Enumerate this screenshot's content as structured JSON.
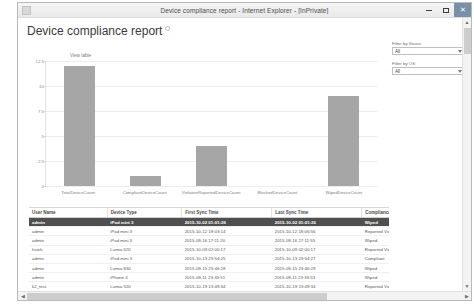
{
  "window": {
    "title": "Device compliance report - Internet Explorer - [InPrivate]",
    "minimize_label": "Minimize",
    "maximize_label": "Restore",
    "close_label": "✕"
  },
  "page": {
    "title": "Device compliance report",
    "view_table_link": "View table"
  },
  "filters": [
    {
      "label": "Filter by Status",
      "value": "All"
    },
    {
      "label": "Filter by OS",
      "value": "All"
    }
  ],
  "chart_data": {
    "type": "bar",
    "title": "",
    "xlabel": "",
    "ylabel": "",
    "categories": [
      "TotalDeviceCount",
      "CompliantDeviceCount",
      "ViolationReportedDeviceCount",
      "BlockedDeviceCount",
      "WipedDeviceCount"
    ],
    "values": [
      12,
      1,
      4,
      0,
      9
    ],
    "ylim": [
      0,
      12.5
    ],
    "yticks": [
      "12.5",
      "10",
      "7.5",
      "5",
      "2.5",
      "0"
    ],
    "ytick_values": [
      12.5,
      10,
      7.5,
      5,
      2.5,
      0
    ],
    "grid": true,
    "legend": "none",
    "bar_color": "#a6a6a6"
  },
  "table": {
    "columns": [
      "User Name",
      "Device Type",
      "First Sync Time",
      "Last Sync Time",
      "Compliance Status"
    ],
    "rows": [
      {
        "user": "admin",
        "device": "iPad mini 3",
        "first": "2015-10-02 01:01:26",
        "last": "2015-10-02 01:01:26",
        "status": "Wiped",
        "selected": true
      },
      {
        "user": "admin",
        "device": "iPad mini 3",
        "first": "2015-10-12 18:03:14",
        "last": "2015-10-12 18:06:56",
        "status": "Reported Violation",
        "selected": false
      },
      {
        "user": "admin",
        "device": "iPad mini 3",
        "first": "2015-09-16 17:11:20",
        "last": "2015-09-16 17:11:55",
        "status": "Wiped",
        "selected": false
      },
      {
        "user": "hsieh",
        "device": "Lumia 620",
        "first": "2015-10-09 02:00:17",
        "last": "2015-10-09 02:00:17",
        "status": "Reported Violation",
        "selected": false
      },
      {
        "user": "admin",
        "device": "iPad mini 3",
        "first": "2015-10-13 23:54:25",
        "last": "2015-10-13 23:54:27",
        "status": "Compliant",
        "selected": false
      },
      {
        "user": "admin",
        "device": "Lumia 830",
        "first": "2015-09-15 23:46:28",
        "last": "2015-09-15 23:46:29",
        "status": "Wiped",
        "selected": false
      },
      {
        "user": "admin",
        "device": "iPhone 4",
        "first": "2015-09-11 23:33:51",
        "last": "2015-09-11 23:33:53",
        "status": "Wiped",
        "selected": false
      },
      {
        "user": "k2_test",
        "device": "Lumia 520",
        "first": "2015-10-19 13:49:34",
        "last": "2015-10-19 13:49:34",
        "status": "Reported Violation",
        "selected": false
      },
      {
        "user": "admin",
        "device": "iPad 2",
        "first": "2015-09-12 00:46:36",
        "last": "2015-09-12 00:46:36",
        "status": "Wiped",
        "selected": false
      },
      {
        "user": "keith",
        "device": "iPhone 6 Plus",
        "first": "2015-09-22 18:14:07",
        "last": "2015-09-20 05:45:24",
        "status": "Wiped",
        "selected": false
      }
    ]
  },
  "scrollbars": {
    "up_arrow": "▲",
    "down_arrow": "▼",
    "left_arrow": "◀",
    "right_arrow": "▶"
  }
}
